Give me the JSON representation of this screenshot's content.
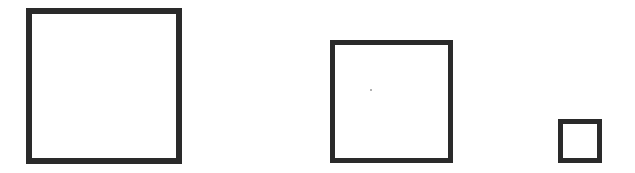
{
  "diagram": {
    "stroke_color": "#2a2a2a",
    "shapes": [
      {
        "name": "large-square",
        "x": 26,
        "y": 8,
        "size": 156,
        "border": 6
      },
      {
        "name": "medium-square",
        "x": 330,
        "y": 40,
        "size": 123,
        "border": 5
      },
      {
        "name": "small-square",
        "x": 558,
        "y": 119,
        "size": 44,
        "border": 5
      }
    ]
  }
}
